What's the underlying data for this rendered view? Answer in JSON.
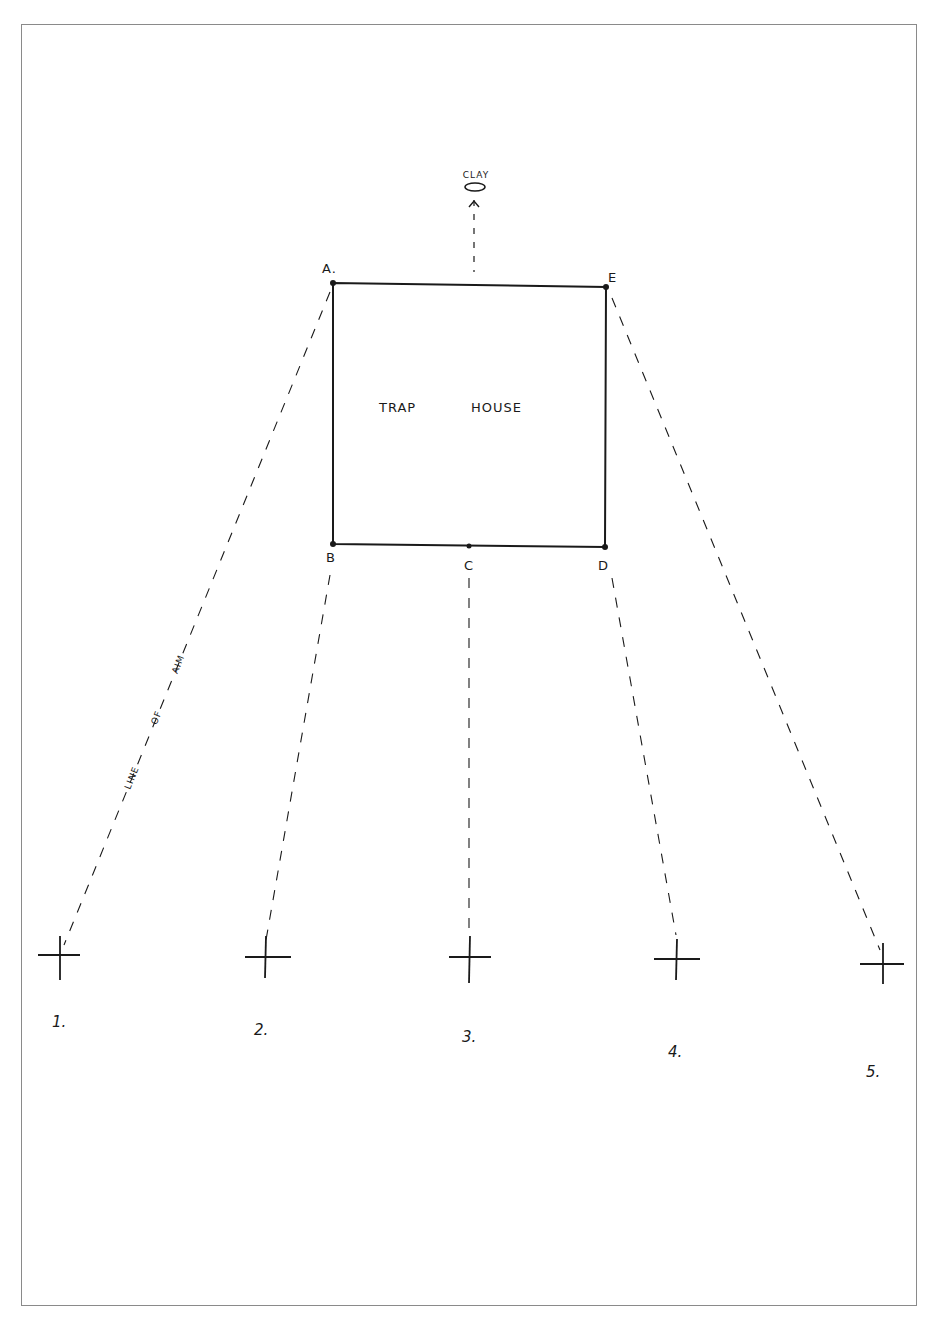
{
  "diagram": {
    "title_label": "TRAP HOUSE",
    "trap_house": {
      "label_left": "TRAP",
      "label_right": "HOUSE"
    },
    "clay": {
      "label": "CLAY"
    },
    "corners": {
      "A": "A.",
      "E": "E",
      "B": "B",
      "C": "C",
      "D": "D"
    },
    "line_of_aim": {
      "words": [
        "LINE",
        "OF",
        "AIM"
      ]
    },
    "stations": [
      {
        "label": "1.",
        "x": 60,
        "y": 955,
        "aim_from": "A"
      },
      {
        "label": "2.",
        "x": 266,
        "y": 956,
        "aim_from": "B"
      },
      {
        "label": "3.",
        "x": 470,
        "y": 957,
        "aim_from": "C"
      },
      {
        "label": "4.",
        "x": 677,
        "y": 959,
        "aim_from": "D"
      },
      {
        "label": "5.",
        "x": 883,
        "y": 963,
        "aim_from": "E"
      }
    ]
  }
}
